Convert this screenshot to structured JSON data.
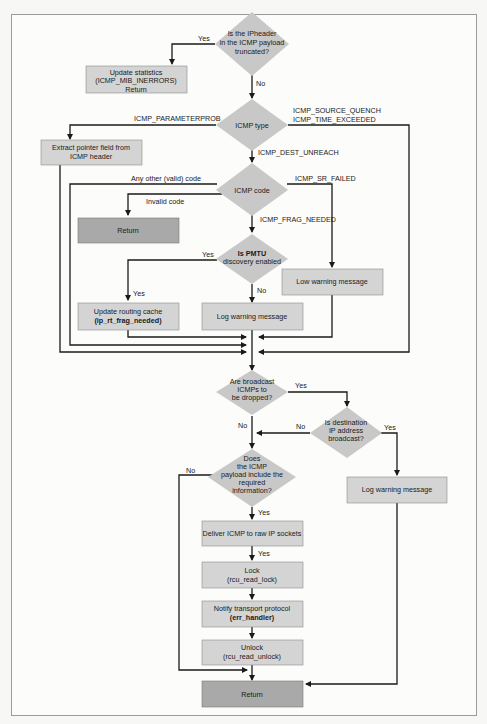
{
  "colors": {
    "box_light": "#d4d4d4",
    "box_dark": "#a9a9a9",
    "decision": "#c8c8c8",
    "stroke": "#1a1a1a",
    "frame": "#9a9a9a"
  },
  "nodes": {
    "truncated": {
      "type": "decision",
      "lines": [
        "Is the IPheader",
        "in the ICMP payload",
        "truncated?"
      ]
    },
    "update_stats": {
      "type": "box",
      "lines": [
        "Update statistics",
        "(ICMP_MIB_INERRORS)",
        "Return"
      ]
    },
    "icmp_type": {
      "type": "decision",
      "lines": [
        "ICMP type"
      ]
    },
    "extract_pointer": {
      "type": "box",
      "lines": [
        "Extract pointer field from",
        "ICMP header"
      ]
    },
    "icmp_code": {
      "type": "decision",
      "lines": [
        "ICMP code"
      ]
    },
    "return_invalid": {
      "type": "box_dark",
      "lines": [
        "Return"
      ]
    },
    "pmtu": {
      "type": "decision",
      "lines": [
        "Is PMTU",
        "discovery enabled"
      ]
    },
    "low_warning": {
      "type": "box",
      "lines": [
        "Low warning message"
      ]
    },
    "update_routing": {
      "type": "box",
      "lines": [
        "Update routing cache",
        "(ip_rt_frag_needed)"
      ]
    },
    "log_warning_1": {
      "type": "box",
      "lines": [
        "Log warning message"
      ]
    },
    "broadcast_drop": {
      "type": "decision",
      "lines": [
        "Are broadcast",
        "ICMPs to",
        "be dropped?"
      ]
    },
    "dest_broadcast": {
      "type": "decision",
      "lines": [
        "Is destination",
        "IP address",
        "broadcast?"
      ]
    },
    "payload_info": {
      "type": "decision",
      "lines": [
        "Does",
        "the ICMP",
        "payload include the",
        "required",
        "information?"
      ]
    },
    "log_warning_2": {
      "type": "box",
      "lines": [
        "Log warning message"
      ]
    },
    "deliver_raw": {
      "type": "box",
      "lines": [
        "Deliver ICMP to raw IP sockets"
      ]
    },
    "lock": {
      "type": "box",
      "lines": [
        "Lock",
        "(rcu_read_lock)"
      ]
    },
    "notify": {
      "type": "box",
      "lines": [
        "Notify transport protocol",
        "(err_handler)"
      ]
    },
    "unlock": {
      "type": "box",
      "lines": [
        "Unlock",
        "(rcu_read_unlock)"
      ]
    },
    "return_final": {
      "type": "box_dark",
      "lines": [
        "Return"
      ]
    }
  },
  "edge_labels": {
    "truncated_yes": "Yes",
    "truncated_no": "No",
    "parameterprob": "ICMP_PARAMETERPROB",
    "source_quench": "ICMP_SOURCE_QUENCH",
    "time_exceeded": "ICMP_TIME_EXCEEDED",
    "dest_unreach": "ICMP_DEST_UNREACH",
    "any_other_code": "Any other (valid) code",
    "sr_failed": "ICMP_SR_FAILED",
    "invalid_code": "Invalid code",
    "frag_needed": "ICMP_FRAG_NEEDED",
    "pmtu_yes_1": "Yes",
    "pmtu_yes_2": "Yes",
    "pmtu_no": "No",
    "bcast_yes": "Yes",
    "bcast_no": "No",
    "dest_no": "No",
    "dest_yes": "Yes",
    "payload_no": "No",
    "payload_yes": "Yes",
    "deliver_yes": "Yes"
  }
}
